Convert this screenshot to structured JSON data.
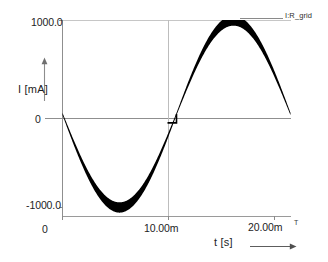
{
  "figure": {
    "title": "",
    "background_color": "#ffffff",
    "trace_color": "#000000",
    "axis_color": "#8a8a8a",
    "grid_color": "#b8b8b8"
  },
  "axes": {
    "y": {
      "label": "I [mA]",
      "ticks": [
        "1000.0",
        "0",
        "-1000.0"
      ],
      "tick_top": "1000.0",
      "tick_zero": "0",
      "tick_bottom": "-1000.0",
      "arrow_icon": "up-arrow-icon"
    },
    "x": {
      "label": "t [s]",
      "ticks": [
        "0",
        "10.00m",
        "20.00m"
      ],
      "tick_start": "0",
      "tick_mid": "10.00m",
      "tick_end": "20.00m",
      "tick_end_marker": "T",
      "arrow_icon": "right-arrow-icon"
    }
  },
  "legend": {
    "entries": [
      {
        "label": "I:R_grid",
        "color": "#000000"
      }
    ],
    "label": "I:R_grid",
    "position": "top-right"
  },
  "chart_data": {
    "type": "line",
    "title": "",
    "xlabel": "t [s]",
    "ylabel": "I [mA]",
    "xlim": [
      0,
      0.02
    ],
    "ylim": [
      -1200,
      1200
    ],
    "xticks": [
      0,
      0.01,
      0.02
    ],
    "xticklabels": [
      "0",
      "10.00m",
      "20.00m"
    ],
    "yticks": [
      1000,
      0,
      -1000
    ],
    "yticklabels": [
      "1000.0",
      "0",
      "-1000.0"
    ],
    "grid": true,
    "grid_lines": {
      "vertical": [
        0.01
      ],
      "horizontal": [
        0
      ]
    },
    "legend": [
      "I:R_grid"
    ],
    "legend_position": "top-right",
    "series": [
      {
        "name": "I:R_grid",
        "color": "#000000",
        "description": "Sinusoidal grid current at 50 Hz with high-frequency switching ripple envelope; negative half-cycle first, small step discontinuity at t = 10.00m",
        "x": [
          0.0,
          0.0005,
          0.001,
          0.0015,
          0.002,
          0.0025,
          0.003,
          0.0035,
          0.004,
          0.0045,
          0.005,
          0.0055,
          0.006,
          0.0065,
          0.007,
          0.0075,
          0.008,
          0.0085,
          0.009,
          0.0095,
          0.00999,
          0.01,
          0.0105,
          0.011,
          0.0115,
          0.012,
          0.0125,
          0.013,
          0.0135,
          0.014,
          0.0145,
          0.015,
          0.0155,
          0.016,
          0.0165,
          0.017,
          0.0175,
          0.018,
          0.0185,
          0.019,
          0.0195,
          0.02
        ],
        "y": [
          0,
          -160,
          -315,
          -462,
          -597,
          -717,
          -818,
          -898,
          -955,
          -988,
          -1000,
          -988,
          -955,
          -898,
          -818,
          -717,
          -597,
          -462,
          -315,
          -160,
          -90,
          0,
          160,
          315,
          462,
          597,
          717,
          818,
          898,
          955,
          988,
          1000,
          988,
          955,
          898,
          818,
          717,
          597,
          462,
          315,
          160,
          0
        ],
        "ripple_amplitude": 55,
        "amplitude": 1000,
        "frequency_hz": 50
      }
    ]
  }
}
